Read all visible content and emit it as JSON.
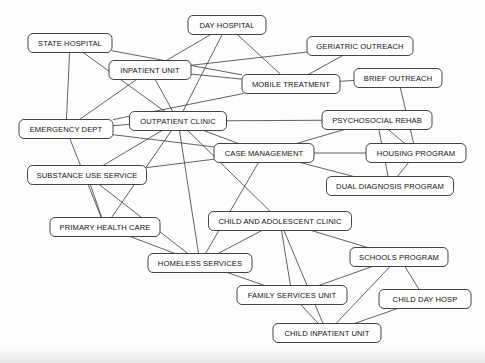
{
  "diagram": {
    "type": "node-link-graph",
    "colors": {
      "background": "#fdfdfd",
      "node_fill": "#ffffff",
      "node_stroke": "#2e2e2e",
      "edge_stroke": "#3a3a3a",
      "label_text": "#111111"
    },
    "nodes": [
      {
        "id": "state_hospital",
        "label": "STATE HOSPITAL",
        "x": 70,
        "y": 43,
        "w": 84,
        "h": 19
      },
      {
        "id": "day_hospital",
        "label": "DAY HOSPITAL",
        "x": 227,
        "y": 25,
        "w": 78,
        "h": 19
      },
      {
        "id": "inpatient_unit",
        "label": "INPATIENT UNIT",
        "x": 150,
        "y": 70,
        "w": 82,
        "h": 19
      },
      {
        "id": "geriatric_outreach",
        "label": "GERIATRIC OUTREACH",
        "x": 360,
        "y": 46,
        "w": 106,
        "h": 19
      },
      {
        "id": "mobile_treatment",
        "label": "MOBILE  TREATMENT",
        "x": 291,
        "y": 84,
        "w": 98,
        "h": 19
      },
      {
        "id": "brief_outreach",
        "label": "BRIEF OUTREACH",
        "x": 398,
        "y": 78,
        "w": 88,
        "h": 19
      },
      {
        "id": "outpatient_clinic",
        "label": "OUTPATIENT CLINIC",
        "x": 178,
        "y": 121,
        "w": 97,
        "h": 19
      },
      {
        "id": "psychosocial_rehab",
        "label": "PSYCHOSOCIAL REHAB",
        "x": 377,
        "y": 120,
        "w": 110,
        "h": 19
      },
      {
        "id": "emergency_dept",
        "label": "EMERGENCY DEPT",
        "x": 66,
        "y": 129,
        "w": 94,
        "h": 19
      },
      {
        "id": "case_management",
        "label": "CASE MANAGEMENT",
        "x": 264,
        "y": 153,
        "w": 100,
        "h": 19
      },
      {
        "id": "housing_program",
        "label": "HOUSING PROGRAM",
        "x": 416,
        "y": 153,
        "w": 100,
        "h": 19
      },
      {
        "id": "substance_use_service",
        "label": "SUBSTANCE USE SERVICE",
        "x": 87,
        "y": 175,
        "w": 119,
        "h": 19
      },
      {
        "id": "dual_diagnosis",
        "label": "DUAL DIAGNOSIS PROGRAM",
        "x": 390,
        "y": 186,
        "w": 127,
        "h": 19
      },
      {
        "id": "child_adolescent",
        "label": "CHILD AND ADOLESCENT CLINIC",
        "x": 280,
        "y": 221,
        "w": 143,
        "h": 19
      },
      {
        "id": "primary_health_care",
        "label": "PRIMARY HEALTH CARE",
        "x": 105,
        "y": 227,
        "w": 110,
        "h": 19
      },
      {
        "id": "schools_program",
        "label": "SCHOOLS PROGRAM",
        "x": 399,
        "y": 257,
        "w": 98,
        "h": 19
      },
      {
        "id": "homeless_services",
        "label": "HOMELESS SERVICES",
        "x": 200,
        "y": 263,
        "w": 104,
        "h": 19
      },
      {
        "id": "family_services_unit",
        "label": "FAMILY SERVICES UNIT",
        "x": 292,
        "y": 295,
        "w": 110,
        "h": 19
      },
      {
        "id": "child_day_hosp",
        "label": "CHILD  DAY  HOSP",
        "x": 425,
        "y": 299,
        "w": 92,
        "h": 19
      },
      {
        "id": "child_inpatient_unit",
        "label": "CHILD INPATIENT UNIT",
        "x": 327,
        "y": 333,
        "w": 108,
        "h": 19
      }
    ],
    "edges": [
      {
        "source": "state_hospital",
        "target": "emergency_dept"
      },
      {
        "source": "state_hospital",
        "target": "outpatient_clinic"
      },
      {
        "source": "state_hospital",
        "target": "mobile_treatment"
      },
      {
        "source": "inpatient_unit",
        "target": "day_hospital"
      },
      {
        "source": "inpatient_unit",
        "target": "geriatric_outreach"
      },
      {
        "source": "inpatient_unit",
        "target": "mobile_treatment"
      },
      {
        "source": "inpatient_unit",
        "target": "outpatient_clinic"
      },
      {
        "source": "inpatient_unit",
        "target": "emergency_dept"
      },
      {
        "source": "day_hospital",
        "target": "outpatient_clinic"
      },
      {
        "source": "day_hospital",
        "target": "mobile_treatment"
      },
      {
        "source": "geriatric_outreach",
        "target": "mobile_treatment"
      },
      {
        "source": "mobile_treatment",
        "target": "brief_outreach"
      },
      {
        "source": "mobile_treatment",
        "target": "emergency_dept"
      },
      {
        "source": "brief_outreach",
        "target": "housing_program"
      },
      {
        "source": "outpatient_clinic",
        "target": "emergency_dept"
      },
      {
        "source": "outpatient_clinic",
        "target": "psychosocial_rehab"
      },
      {
        "source": "outpatient_clinic",
        "target": "case_management"
      },
      {
        "source": "outpatient_clinic",
        "target": "substance_use_service"
      },
      {
        "source": "outpatient_clinic",
        "target": "primary_health_care"
      },
      {
        "source": "outpatient_clinic",
        "target": "homeless_services"
      },
      {
        "source": "outpatient_clinic",
        "target": "child_adolescent"
      },
      {
        "source": "psychosocial_rehab",
        "target": "case_management"
      },
      {
        "source": "psychosocial_rehab",
        "target": "housing_program"
      },
      {
        "source": "psychosocial_rehab",
        "target": "dual_diagnosis"
      },
      {
        "source": "case_management",
        "target": "housing_program"
      },
      {
        "source": "case_management",
        "target": "dual_diagnosis"
      },
      {
        "source": "case_management",
        "target": "emergency_dept"
      },
      {
        "source": "case_management",
        "target": "substance_use_service"
      },
      {
        "source": "case_management",
        "target": "homeless_services"
      },
      {
        "source": "housing_program",
        "target": "dual_diagnosis"
      },
      {
        "source": "emergency_dept",
        "target": "primary_health_care"
      },
      {
        "source": "substance_use_service",
        "target": "homeless_services"
      },
      {
        "source": "substance_use_service",
        "target": "primary_health_care"
      },
      {
        "source": "primary_health_care",
        "target": "homeless_services"
      },
      {
        "source": "homeless_services",
        "target": "child_adolescent"
      },
      {
        "source": "homeless_services",
        "target": "family_services_unit"
      },
      {
        "source": "child_adolescent",
        "target": "family_services_unit"
      },
      {
        "source": "child_adolescent",
        "target": "schools_program"
      },
      {
        "source": "child_adolescent",
        "target": "child_inpatient_unit"
      },
      {
        "source": "schools_program",
        "target": "child_day_hosp"
      },
      {
        "source": "schools_program",
        "target": "child_inpatient_unit"
      },
      {
        "source": "schools_program",
        "target": "family_services_unit"
      },
      {
        "source": "family_services_unit",
        "target": "child_inpatient_unit"
      },
      {
        "source": "child_inpatient_unit",
        "target": "child_day_hosp"
      }
    ]
  }
}
